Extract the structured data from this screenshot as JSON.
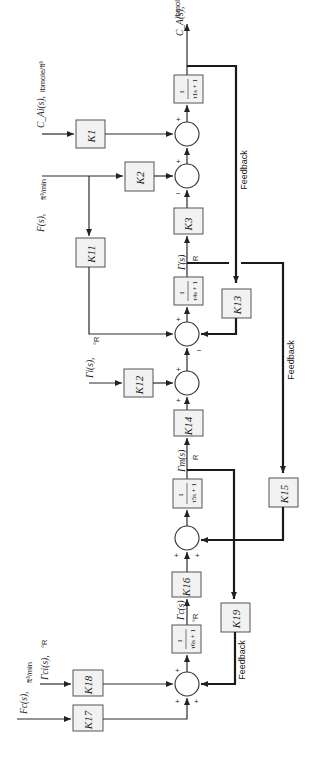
{
  "diagram": {
    "orientation": "rotated 90 degrees counter-clockwise",
    "output": {
      "variable": "C_A(s),",
      "unit": "lbmole/ft³"
    },
    "inputs": [
      {
        "id": "CAi",
        "variable": "C_Ai(s),",
        "unit": "lbmole/ft³"
      },
      {
        "id": "F",
        "variable": "F(s),",
        "unit": "ft³/min"
      },
      {
        "id": "Ti",
        "variable": "Γi(s),",
        "unit": "°R"
      },
      {
        "id": "Fc",
        "variable": "Fc(s),",
        "unit": "ft³/min"
      },
      {
        "id": "Tci",
        "variable": "Γci(s),",
        "unit": "°R"
      }
    ],
    "signals": [
      {
        "id": "T",
        "variable": "Γ(s)",
        "unit": "R"
      },
      {
        "id": "Tm",
        "variable": "Γm(s)",
        "unit": "R"
      },
      {
        "id": "Tc",
        "variable": "Γc(s)",
        "unit": "°R"
      }
    ],
    "gains": {
      "K1": "K1",
      "K2": "K2",
      "K3": "K3",
      "K11": "K11",
      "K12": "K12",
      "K13": "K13",
      "K14": "K14",
      "K15": "K15",
      "K16": "K16",
      "K17": "K17",
      "K18": "K18",
      "K19": "K19"
    },
    "transfer_functions": {
      "tau1": {
        "num": "1",
        "den": "τ1s + 1"
      },
      "tau4": {
        "num": "1",
        "den": "τ4s + 1"
      },
      "tau5": {
        "num": "1",
        "den": "τ5s + 1"
      },
      "tau6": {
        "num": "1",
        "den": "τ6s + 1"
      }
    },
    "feedback_labels": [
      "Feedback",
      "Feedback",
      "Feedback"
    ],
    "summer_signs": {
      "s1": [
        "+",
        "+"
      ],
      "s2": [
        "+",
        "−"
      ],
      "s3": [
        "+",
        "−"
      ],
      "s4": [
        "+",
        "+"
      ],
      "s5": [
        "+",
        "+"
      ],
      "s6": [
        "+",
        "+",
        "+"
      ]
    }
  }
}
